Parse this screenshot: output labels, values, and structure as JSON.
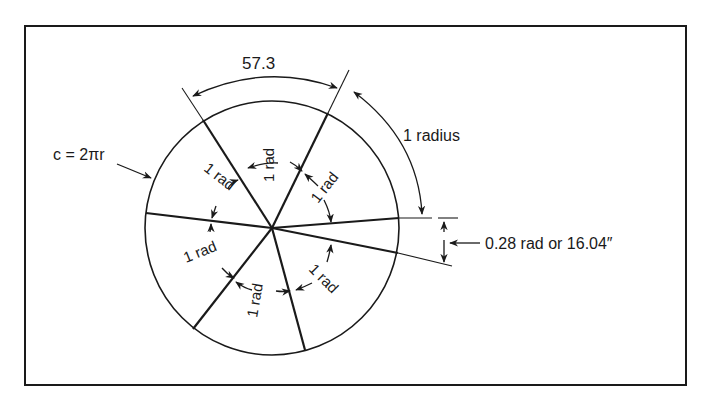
{
  "diagram": {
    "colors": {
      "ink": "#1a1a1a",
      "background": "#ffffff"
    },
    "labels": {
      "arc_degrees": "57.3",
      "radius_arc": "1 radius",
      "circumference": "c = 2πr",
      "remainder": "0.28 rad or 16.04″",
      "sector": "1 rad"
    },
    "sectors": [
      {
        "label": "1 rad",
        "position": "top"
      },
      {
        "label": "1 rad",
        "position": "upper-right"
      },
      {
        "label": "1 rad",
        "position": "upper-left"
      },
      {
        "label": "1 rad",
        "position": "lower-left"
      },
      {
        "label": "1 rad",
        "position": "bottom"
      },
      {
        "label": "1 rad",
        "position": "lower-right"
      }
    ]
  }
}
